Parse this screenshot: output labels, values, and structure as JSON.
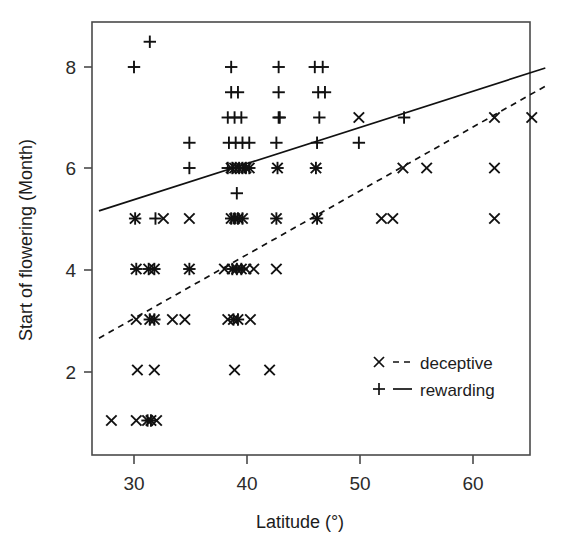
{
  "chart_data": {
    "type": "scatter",
    "title": "",
    "xlabel": "Latitude (°)",
    "ylabel": "Start of flowering (Month)",
    "xlim": [
      26.5,
      66.5
    ],
    "ylim": [
      0.4,
      8.9
    ],
    "xticks": [
      30,
      40,
      50,
      60
    ],
    "yticks": [
      2,
      4,
      6,
      8
    ],
    "xtick_labels": [
      "30",
      "40",
      "50",
      "60"
    ],
    "ytick_labels": [
      "2",
      "4",
      "6",
      "8"
    ],
    "grid": false,
    "legend_position": "inside-lower-right",
    "legend": [
      {
        "label": "deceptive",
        "marker": "x",
        "line": "dashed"
      },
      {
        "label": "rewarding",
        "marker": "+",
        "line": "solid"
      }
    ],
    "series": [
      {
        "name": "rewarding",
        "marker": "+",
        "line": "solid",
        "fit_line": {
          "x": [
            26.9,
            66.4
          ],
          "y": [
            5.15,
            7.98
          ]
        },
        "points": [
          [
            31.4,
            8.5
          ],
          [
            30.0,
            8.0
          ],
          [
            38.6,
            8.0
          ],
          [
            42.8,
            8.0
          ],
          [
            46.0,
            8.0
          ],
          [
            46.7,
            8.0
          ],
          [
            38.6,
            7.5
          ],
          [
            39.2,
            7.5
          ],
          [
            42.8,
            7.5
          ],
          [
            46.3,
            7.5
          ],
          [
            46.9,
            7.5
          ],
          [
            38.3,
            7.0
          ],
          [
            38.9,
            7.0
          ],
          [
            39.5,
            7.0
          ],
          [
            42.8,
            7.0
          ],
          [
            42.9,
            7.0
          ],
          [
            46.4,
            7.0
          ],
          [
            53.9,
            7.0
          ],
          [
            34.9,
            6.5
          ],
          [
            38.4,
            6.5
          ],
          [
            39.0,
            6.5
          ],
          [
            39.6,
            6.5
          ],
          [
            40.2,
            6.5
          ],
          [
            42.6,
            6.5
          ],
          [
            46.2,
            6.5
          ],
          [
            49.9,
            6.5
          ],
          [
            34.9,
            6.0
          ],
          [
            38.3,
            6.0
          ],
          [
            38.7,
            6.0
          ],
          [
            39.0,
            6.0
          ],
          [
            39.3,
            6.0
          ],
          [
            39.6,
            6.0
          ],
          [
            39.9,
            6.0
          ],
          [
            40.2,
            6.0
          ],
          [
            42.7,
            6.0
          ],
          [
            46.1,
            6.0
          ],
          [
            39.1,
            5.5
          ],
          [
            30.1,
            5.0
          ],
          [
            31.9,
            5.0
          ],
          [
            38.6,
            5.0
          ],
          [
            38.9,
            5.0
          ],
          [
            39.2,
            5.0
          ],
          [
            39.6,
            5.0
          ],
          [
            42.6,
            5.0
          ],
          [
            46.2,
            5.0
          ],
          [
            30.2,
            4.0
          ],
          [
            31.3,
            4.0
          ],
          [
            31.8,
            4.0
          ],
          [
            34.9,
            4.0
          ],
          [
            38.7,
            4.0
          ],
          [
            39.1,
            4.0
          ],
          [
            39.5,
            4.0
          ],
          [
            31.4,
            3.0
          ],
          [
            31.8,
            3.0
          ],
          [
            38.8,
            3.0
          ],
          [
            39.2,
            3.0
          ],
          [
            31.2,
            1.0
          ],
          [
            31.5,
            1.0
          ]
        ]
      },
      {
        "name": "deceptive",
        "marker": "x",
        "line": "dashed",
        "fit_line": {
          "x": [
            26.9,
            66.4
          ],
          "y": [
            2.63,
            7.62
          ]
        },
        "points": [
          [
            49.9,
            7.0
          ],
          [
            61.9,
            7.0
          ],
          [
            65.2,
            7.0
          ],
          [
            38.6,
            6.0
          ],
          [
            38.9,
            6.0
          ],
          [
            39.2,
            6.0
          ],
          [
            39.5,
            6.0
          ],
          [
            39.9,
            6.0
          ],
          [
            40.2,
            6.0
          ],
          [
            42.7,
            6.0
          ],
          [
            46.1,
            6.0
          ],
          [
            53.8,
            6.0
          ],
          [
            55.9,
            6.0
          ],
          [
            61.9,
            6.0
          ],
          [
            30.1,
            5.0
          ],
          [
            32.6,
            5.0
          ],
          [
            34.9,
            5.0
          ],
          [
            38.6,
            5.0
          ],
          [
            38.9,
            5.0
          ],
          [
            39.2,
            5.0
          ],
          [
            39.6,
            5.0
          ],
          [
            42.6,
            5.0
          ],
          [
            46.2,
            5.0
          ],
          [
            51.9,
            5.0
          ],
          [
            52.9,
            5.0
          ],
          [
            61.9,
            5.0
          ],
          [
            30.2,
            4.0
          ],
          [
            31.3,
            4.0
          ],
          [
            31.8,
            4.0
          ],
          [
            34.9,
            4.0
          ],
          [
            38.0,
            4.0
          ],
          [
            38.7,
            4.0
          ],
          [
            39.1,
            4.0
          ],
          [
            39.5,
            4.0
          ],
          [
            39.9,
            4.0
          ],
          [
            40.6,
            4.0
          ],
          [
            42.6,
            4.0
          ],
          [
            30.2,
            3.0
          ],
          [
            31.4,
            3.0
          ],
          [
            31.8,
            3.0
          ],
          [
            33.4,
            3.0
          ],
          [
            34.5,
            3.0
          ],
          [
            38.3,
            3.0
          ],
          [
            38.8,
            3.0
          ],
          [
            39.2,
            3.0
          ],
          [
            40.3,
            3.0
          ],
          [
            30.3,
            2.0
          ],
          [
            31.8,
            2.0
          ],
          [
            38.9,
            2.0
          ],
          [
            42.0,
            2.0
          ],
          [
            28.0,
            1.0
          ],
          [
            30.2,
            1.0
          ],
          [
            31.2,
            1.0
          ],
          [
            31.5,
            1.0
          ],
          [
            32.0,
            1.0
          ]
        ]
      }
    ]
  },
  "axes": {
    "x_title": "Latitude (°)",
    "y_title": "Start of flowering (Month)"
  },
  "legend_items": {
    "deceptive": "deceptive",
    "rewarding": "rewarding"
  }
}
